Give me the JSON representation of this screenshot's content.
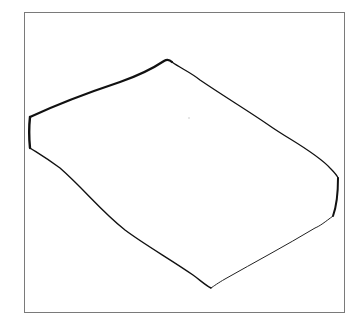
{
  "figure": {
    "frame_color": "#7a7a7a",
    "stroke_color": "#111111",
    "background": "#ffffff"
  }
}
